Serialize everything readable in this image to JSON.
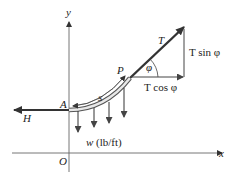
{
  "diagram": {
    "axes": {
      "x_label": "x",
      "y_label": "y",
      "origin_label": "O"
    },
    "points": {
      "A": "A",
      "P": "P"
    },
    "forces": {
      "horizontal_tension": "H",
      "tension": "T",
      "angle": "φ",
      "horizontal_component": "T cos φ",
      "vertical_component": "T sin φ"
    },
    "arc_length_label": "s",
    "load_label": "w (lb/ft)",
    "colors": {
      "line": "#333333",
      "cable_outer": "#555555",
      "cable_fill": "#e8e8e8",
      "text": "#222222"
    }
  }
}
